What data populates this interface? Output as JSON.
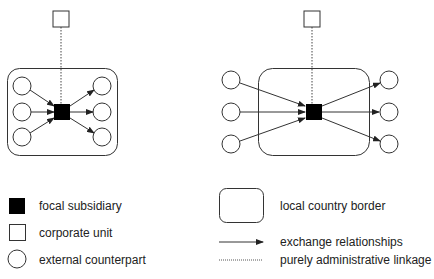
{
  "diagrams": [
    {
      "name": "local-embedded-configuration",
      "external_counterparts_inside_border": true,
      "inbound_counterparts": 3,
      "outbound_counterparts": 3
    },
    {
      "name": "external-spanning-configuration",
      "external_counterparts_inside_border": false,
      "inbound_counterparts": 3,
      "outbound_counterparts": 3
    }
  ],
  "legend": {
    "focal_subsidiary": "focal subsidiary",
    "corporate_unit": "corporate unit",
    "external_counterpart": "external counterpart",
    "local_country_border": "local country border",
    "exchange_relationships": "exchange relationships",
    "administrative_linkage": "purely administrative linkage"
  },
  "colors": {
    "stroke": "#333333",
    "fill_focal": "#000000",
    "fill_empty": "#ffffff",
    "text": "#222222"
  }
}
